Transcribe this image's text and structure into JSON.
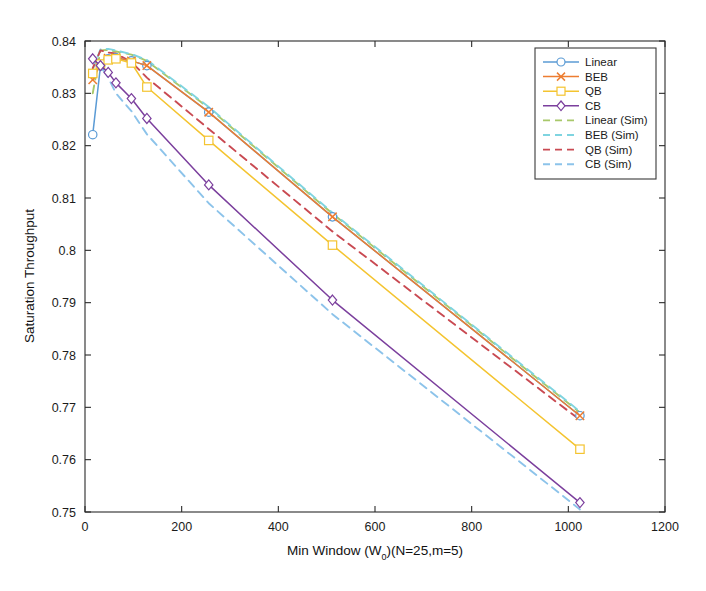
{
  "chart_data": {
    "type": "line",
    "title": "",
    "xlabel": "Min Window (W_0)(N=25,m=5)",
    "xlabel_main": "Min Window (W",
    "xlabel_sub": "0",
    "xlabel_tail": ")(N=25,m=5)",
    "ylabel": "Saturation Throughput",
    "xlim": [
      0,
      1200
    ],
    "ylim": [
      0.75,
      0.84
    ],
    "xticks": [
      0,
      200,
      400,
      600,
      800,
      1000,
      1200
    ],
    "xtick_labels": [
      "0",
      "200",
      "400",
      "600",
      "800",
      "1000",
      "1200"
    ],
    "yticks": [
      0.75,
      0.76,
      0.77,
      0.78,
      0.79,
      0.8,
      0.81,
      0.82,
      0.83,
      0.84
    ],
    "ytick_labels": [
      "0.75",
      "0.76",
      "0.77",
      "0.78",
      "0.79",
      "0.8",
      "0.81",
      "0.82",
      "0.83",
      "0.84"
    ],
    "grid": false,
    "legend_position": "upper right",
    "legend_entries": [
      {
        "label": "Linear",
        "color": "#5b9bd5",
        "style": "solid",
        "marker": "circle"
      },
      {
        "label": "BEB",
        "color": "#ed7d31",
        "style": "solid",
        "marker": "x"
      },
      {
        "label": "QB",
        "color": "#f4c430",
        "style": "solid",
        "marker": "square"
      },
      {
        "label": "CB",
        "color": "#7b3f9d",
        "style": "solid",
        "marker": "diamond"
      },
      {
        "label": "Linear (Sim)",
        "color": "#a8c86a",
        "style": "dashed",
        "marker": "none"
      },
      {
        "label": "BEB (Sim)",
        "color": "#7fd4e0",
        "style": "dashed",
        "marker": "none"
      },
      {
        "label": "QB (Sim)",
        "color": "#c94a52",
        "style": "dashed",
        "marker": "none"
      },
      {
        "label": "CB (Sim)",
        "color": "#8cc3ea",
        "style": "dashed",
        "marker": "none"
      }
    ],
    "x": [
      16,
      32,
      48,
      64,
      96,
      128,
      256,
      512,
      1024
    ],
    "series": [
      {
        "name": "Linear",
        "color": "#5b9bd5",
        "style": "solid",
        "marker": "circle",
        "x": [
          16,
          32,
          48,
          64,
          96,
          128,
          256,
          512,
          1024
        ],
        "values": [
          0.8221,
          0.8352,
          0.8366,
          0.8368,
          0.8362,
          0.8353,
          0.8264,
          0.8064,
          0.7684
        ]
      },
      {
        "name": "BEB",
        "color": "#ed7d31",
        "style": "solid",
        "marker": "x",
        "x": [
          16,
          32,
          48,
          64,
          96,
          128,
          256,
          512,
          1024
        ],
        "values": [
          0.8326,
          0.8356,
          0.8367,
          0.8368,
          0.8362,
          0.8353,
          0.8264,
          0.8064,
          0.7684
        ]
      },
      {
        "name": "QB",
        "color": "#f4c430",
        "style": "solid",
        "marker": "square",
        "x": [
          16,
          32,
          48,
          64,
          96,
          128,
          256,
          512,
          1024
        ],
        "values": [
          0.8338,
          0.8356,
          0.8364,
          0.8366,
          0.8358,
          0.8312,
          0.821,
          0.801,
          0.762
        ]
      },
      {
        "name": "CB",
        "color": "#7b3f9d",
        "style": "solid",
        "marker": "diamond",
        "x": [
          16,
          32,
          48,
          64,
          96,
          128,
          256,
          512,
          1024
        ],
        "values": [
          0.8366,
          0.8353,
          0.834,
          0.832,
          0.829,
          0.8252,
          0.8125,
          0.7905,
          0.7518
        ]
      },
      {
        "name": "Linear (Sim)",
        "color": "#a8c86a",
        "style": "dashed",
        "marker": "none",
        "x": [
          16,
          32,
          48,
          64,
          96,
          128,
          256,
          512,
          1024
        ],
        "values": [
          0.83,
          0.8382,
          0.8383,
          0.838,
          0.8374,
          0.8362,
          0.8272,
          0.807,
          0.769
        ]
      },
      {
        "name": "BEB (Sim)",
        "color": "#7fd4e0",
        "style": "dashed",
        "marker": "none",
        "x": [
          16,
          32,
          48,
          64,
          96,
          128,
          256,
          512,
          1024
        ],
        "values": [
          0.8345,
          0.8384,
          0.8385,
          0.8382,
          0.8375,
          0.8364,
          0.8274,
          0.8072,
          0.7692
        ]
      },
      {
        "name": "QB (Sim)",
        "color": "#c94a52",
        "style": "dashed",
        "marker": "none",
        "x": [
          16,
          32,
          48,
          64,
          96,
          128,
          256,
          512,
          1024
        ],
        "values": [
          0.8348,
          0.8382,
          0.8378,
          0.8376,
          0.836,
          0.833,
          0.8232,
          0.8036,
          0.7676
        ]
      },
      {
        "name": "CB (Sim)",
        "color": "#8cc3ea",
        "style": "dashed",
        "marker": "none",
        "x": [
          16,
          32,
          48,
          64,
          96,
          128,
          256,
          512,
          1024
        ],
        "values": [
          0.836,
          0.8352,
          0.833,
          0.83,
          0.8266,
          0.8222,
          0.809,
          0.7878,
          0.7505
        ]
      }
    ]
  },
  "axes": {
    "y_axis_title": "Saturation Throughput"
  }
}
